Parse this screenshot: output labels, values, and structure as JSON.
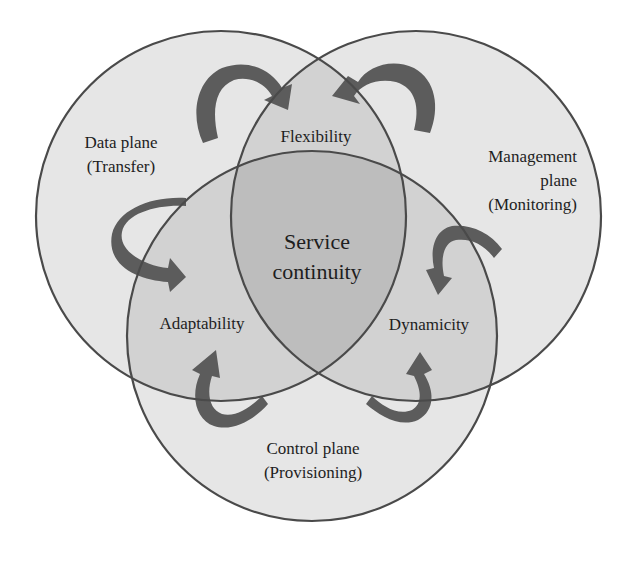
{
  "colors": {
    "background": "#ffffff",
    "single_region": "#e6e6e6",
    "double_overlap": "#d2d2d2",
    "triple_overlap": "#bdbdbd",
    "outline": "#4a4a4a",
    "arrow": "#5c5c5c",
    "text": "#1e1e1e"
  },
  "circles": {
    "data_plane": {
      "name": "Data plane",
      "sub": "(Transfer)"
    },
    "management_plane": {
      "line1": "Management",
      "line2": "plane",
      "sub": "(Monitoring)"
    },
    "control_plane": {
      "name": "Control plane",
      "sub": "(Provisioning)"
    }
  },
  "overlaps": {
    "data_management": "Flexibility",
    "data_control": "Adaptability",
    "management_control": "Dynamicity"
  },
  "center": {
    "line1": "Service",
    "line2": "continuity"
  },
  "arrows": [
    {
      "id": "data-to-flexibility",
      "from": "Data plane",
      "to": "Flexibility"
    },
    {
      "id": "management-to-flexibility",
      "from": "Management plane",
      "to": "Flexibility"
    },
    {
      "id": "data-to-adaptability",
      "from": "Data plane",
      "to": "Adaptability"
    },
    {
      "id": "management-to-dynamicity",
      "from": "Management plane",
      "to": "Dynamicity"
    },
    {
      "id": "control-to-adaptability",
      "from": "Control plane",
      "to": "Adaptability"
    },
    {
      "id": "control-to-dynamicity",
      "from": "Control plane",
      "to": "Dynamicity"
    }
  ]
}
